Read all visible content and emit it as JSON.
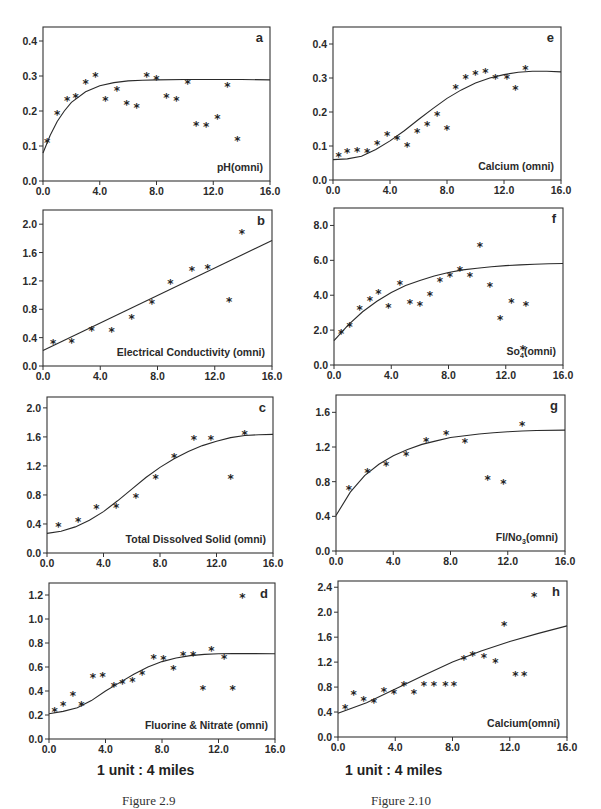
{
  "figures": [
    {
      "caption": "Figure 2.9",
      "scale_label": "1 unit : 4 miles"
    },
    {
      "caption": "Figure 2.10",
      "scale_label": "1 unit : 4 miles"
    }
  ],
  "chart_data": [
    {
      "id": "a",
      "type": "scatter",
      "title": "a",
      "annotation": "pH(omni)",
      "xlabel": "",
      "ylabel": "",
      "xlim": [
        0,
        16
      ],
      "ylim": [
        0,
        0.44
      ],
      "xticks": [
        0,
        4,
        8,
        12,
        16
      ],
      "xtick_labels": [
        "0.0",
        "4.0",
        "8.0",
        "12.0",
        "16.0"
      ],
      "yticks": [
        0,
        0.1,
        0.2,
        0.3,
        0.4
      ],
      "ytick_labels": [
        "0.0",
        "0.1",
        "0.2",
        "0.3",
        "0.4"
      ],
      "points": [
        [
          0.3,
          0.11
        ],
        [
          1.0,
          0.19
        ],
        [
          1.7,
          0.23
        ],
        [
          2.3,
          0.24
        ],
        [
          3.0,
          0.28
        ],
        [
          3.7,
          0.3
        ],
        [
          4.4,
          0.23
        ],
        [
          5.2,
          0.26
        ],
        [
          5.9,
          0.22
        ],
        [
          6.6,
          0.21
        ],
        [
          7.3,
          0.3
        ],
        [
          8.0,
          0.29
        ],
        [
          8.7,
          0.24
        ],
        [
          9.4,
          0.23
        ],
        [
          10.2,
          0.28
        ],
        [
          10.8,
          0.16
        ],
        [
          11.5,
          0.155
        ],
        [
          12.3,
          0.18
        ],
        [
          13.0,
          0.27
        ],
        [
          13.7,
          0.115
        ]
      ],
      "fit_curve": [
        [
          0,
          0.08
        ],
        [
          0.5,
          0.13
        ],
        [
          1,
          0.17
        ],
        [
          1.5,
          0.2
        ],
        [
          2,
          0.225
        ],
        [
          3,
          0.255
        ],
        [
          4,
          0.272
        ],
        [
          5,
          0.281
        ],
        [
          6,
          0.286
        ],
        [
          7,
          0.288
        ],
        [
          8,
          0.289
        ],
        [
          10,
          0.29
        ],
        [
          12,
          0.29
        ],
        [
          14,
          0.29
        ],
        [
          16,
          0.289
        ]
      ],
      "grid": false,
      "legend": "none"
    },
    {
      "id": "b",
      "type": "scatter",
      "title": "b",
      "annotation": "Electrical Conductivity (omni)",
      "xlabel": "",
      "ylabel": "",
      "xlim": [
        0,
        16
      ],
      "ylim": [
        0,
        2.2
      ],
      "xticks": [
        0,
        4,
        8,
        12,
        16
      ],
      "xtick_labels": [
        "0.0",
        "4.0",
        "8.0",
        "12.0",
        "16.0"
      ],
      "yticks": [
        0,
        0.4,
        0.8,
        1.2,
        1.6,
        2.0
      ],
      "ytick_labels": [
        "0.0",
        "0.4",
        "0.8",
        "1.2",
        "1.6",
        "2.0"
      ],
      "points": [
        [
          0.7,
          0.32
        ],
        [
          2.0,
          0.33
        ],
        [
          3.4,
          0.5
        ],
        [
          4.8,
          0.48
        ],
        [
          6.2,
          0.67
        ],
        [
          7.6,
          0.88
        ],
        [
          8.9,
          1.16
        ],
        [
          10.4,
          1.35
        ],
        [
          11.5,
          1.37
        ],
        [
          13.0,
          0.91
        ],
        [
          13.9,
          1.87
        ]
      ],
      "fit_curve": [
        [
          0,
          0.22
        ],
        [
          16,
          1.77
        ]
      ],
      "grid": false,
      "legend": "none"
    },
    {
      "id": "c",
      "type": "scatter",
      "title": "c",
      "annotation": "Total Dissolved Solid (omni)",
      "xlabel": "",
      "ylabel": "",
      "xlim": [
        0,
        16
      ],
      "ylim": [
        0,
        2.15
      ],
      "xticks": [
        0,
        4,
        8,
        12,
        16
      ],
      "xtick_labels": [
        "0.0",
        "4.0",
        "8.0",
        "12.0",
        "16.0"
      ],
      "yticks": [
        0,
        0.4,
        0.8,
        1.2,
        1.6,
        2.0
      ],
      "ytick_labels": [
        "0.0",
        "0.4",
        "0.8",
        "1.2",
        "1.6",
        "2.0"
      ],
      "points": [
        [
          0.8,
          0.36
        ],
        [
          2.2,
          0.43
        ],
        [
          3.5,
          0.62
        ],
        [
          4.9,
          0.63
        ],
        [
          6.3,
          0.77
        ],
        [
          7.7,
          1.03
        ],
        [
          9.0,
          1.31
        ],
        [
          10.4,
          1.56
        ],
        [
          11.6,
          1.56
        ],
        [
          13.0,
          1.02
        ],
        [
          14.0,
          1.63
        ]
      ],
      "fit_curve": [
        [
          0,
          0.27
        ],
        [
          1,
          0.3
        ],
        [
          2,
          0.36
        ],
        [
          3,
          0.45
        ],
        [
          4,
          0.57
        ],
        [
          5,
          0.72
        ],
        [
          6,
          0.88
        ],
        [
          7,
          1.04
        ],
        [
          8,
          1.18
        ],
        [
          9,
          1.3
        ],
        [
          10,
          1.4
        ],
        [
          11,
          1.48
        ],
        [
          12,
          1.54
        ],
        [
          13,
          1.59
        ],
        [
          14,
          1.62
        ],
        [
          15,
          1.63
        ],
        [
          16,
          1.635
        ]
      ],
      "grid": false,
      "legend": "none"
    },
    {
      "id": "d",
      "type": "scatter",
      "title": "d",
      "annotation": "Fluorine & Nitrate (omni)",
      "xlabel": "1 unit : 4 miles",
      "ylabel": "",
      "xlim": [
        0,
        16
      ],
      "ylim": [
        0,
        1.3
      ],
      "xticks": [
        0,
        4,
        8,
        12,
        16
      ],
      "xtick_labels": [
        "0.0",
        "4.0",
        "8.0",
        "12.0",
        "16.0"
      ],
      "yticks": [
        0,
        0.2,
        0.4,
        0.6,
        0.8,
        1.0,
        1.2
      ],
      "ytick_labels": [
        "0.0",
        "0.2",
        "0.4",
        "0.6",
        "0.8",
        "1.0",
        "1.2"
      ],
      "points": [
        [
          0.4,
          0.23
        ],
        [
          1.0,
          0.28
        ],
        [
          1.7,
          0.36
        ],
        [
          2.3,
          0.28
        ],
        [
          3.1,
          0.51
        ],
        [
          3.8,
          0.52
        ],
        [
          4.6,
          0.44
        ],
        [
          5.2,
          0.46
        ],
        [
          5.9,
          0.48
        ],
        [
          6.6,
          0.54
        ],
        [
          7.4,
          0.67
        ],
        [
          8.1,
          0.66
        ],
        [
          8.8,
          0.58
        ],
        [
          9.5,
          0.7
        ],
        [
          10.2,
          0.7
        ],
        [
          10.9,
          0.41
        ],
        [
          11.5,
          0.74
        ],
        [
          12.4,
          0.67
        ],
        [
          13.0,
          0.41
        ],
        [
          13.7,
          1.18
        ]
      ],
      "fit_curve": [
        [
          0,
          0.21
        ],
        [
          1,
          0.23
        ],
        [
          2,
          0.26
        ],
        [
          3,
          0.32
        ],
        [
          4,
          0.4
        ],
        [
          5,
          0.47
        ],
        [
          6,
          0.54
        ],
        [
          7,
          0.6
        ],
        [
          8,
          0.645
        ],
        [
          9,
          0.675
        ],
        [
          10,
          0.695
        ],
        [
          11,
          0.705
        ],
        [
          12,
          0.71
        ],
        [
          13,
          0.712
        ],
        [
          14,
          0.712
        ],
        [
          16,
          0.71
        ]
      ],
      "grid": false,
      "legend": "none"
    },
    {
      "id": "e",
      "type": "scatter",
      "title": "e",
      "annotation": "Calcium (omni)",
      "xlabel": "",
      "ylabel": "",
      "xlim": [
        0,
        16
      ],
      "ylim": [
        0,
        0.45
      ],
      "xticks": [
        0,
        4,
        8,
        12,
        16
      ],
      "xtick_labels": [
        "0.0",
        "4.0",
        "8.0",
        "12.0",
        "16.0"
      ],
      "yticks": [
        0,
        0.1,
        0.2,
        0.3,
        0.4
      ],
      "ytick_labels": [
        "0.0",
        "0.1",
        "0.2",
        "0.3",
        "0.4"
      ],
      "points": [
        [
          0.4,
          0.07
        ],
        [
          1.0,
          0.08
        ],
        [
          1.7,
          0.085
        ],
        [
          2.4,
          0.08
        ],
        [
          3.1,
          0.105
        ],
        [
          3.8,
          0.13
        ],
        [
          4.5,
          0.12
        ],
        [
          5.2,
          0.1
        ],
        [
          5.9,
          0.14
        ],
        [
          6.6,
          0.16
        ],
        [
          7.3,
          0.19
        ],
        [
          8.0,
          0.15
        ],
        [
          8.6,
          0.27
        ],
        [
          9.3,
          0.3
        ],
        [
          10.0,
          0.31
        ],
        [
          10.7,
          0.315
        ],
        [
          11.4,
          0.3
        ],
        [
          12.2,
          0.3
        ],
        [
          12.8,
          0.265
        ],
        [
          13.5,
          0.325
        ]
      ],
      "fit_curve": [
        [
          0,
          0.06
        ],
        [
          1,
          0.062
        ],
        [
          2,
          0.07
        ],
        [
          3,
          0.09
        ],
        [
          4,
          0.115
        ],
        [
          5,
          0.145
        ],
        [
          6,
          0.178
        ],
        [
          7,
          0.21
        ],
        [
          8,
          0.24
        ],
        [
          9,
          0.265
        ],
        [
          10,
          0.285
        ],
        [
          11,
          0.3
        ],
        [
          12,
          0.31
        ],
        [
          13,
          0.317
        ],
        [
          14,
          0.32
        ],
        [
          15,
          0.32
        ],
        [
          16,
          0.318
        ]
      ],
      "grid": false,
      "legend": "none"
    },
    {
      "id": "f",
      "type": "scatter",
      "title": "f",
      "annotation": "So4(omni)",
      "xlabel": "",
      "ylabel": "",
      "xlim": [
        0,
        16
      ],
      "ylim": [
        0,
        9.0
      ],
      "xticks": [
        0,
        4,
        8,
        12,
        16
      ],
      "xtick_labels": [
        "0.0",
        "4.0",
        "8.0",
        "12.0",
        "16.0"
      ],
      "yticks": [
        0,
        2,
        4,
        6,
        8
      ],
      "ytick_labels": [
        "0.0",
        "2.0",
        "4.0",
        "6.0",
        "8.0"
      ],
      "points": [
        [
          0.5,
          1.8
        ],
        [
          1.1,
          2.2
        ],
        [
          1.8,
          3.2
        ],
        [
          2.5,
          3.7
        ],
        [
          3.1,
          4.1
        ],
        [
          3.8,
          3.3
        ],
        [
          4.6,
          4.6
        ],
        [
          5.3,
          3.5
        ],
        [
          6.0,
          3.4
        ],
        [
          6.7,
          4.0
        ],
        [
          7.4,
          4.8
        ],
        [
          8.1,
          5.1
        ],
        [
          8.8,
          5.4
        ],
        [
          9.5,
          5.1
        ],
        [
          10.2,
          6.8
        ],
        [
          10.9,
          4.5
        ],
        [
          11.6,
          2.6
        ],
        [
          12.4,
          3.6
        ],
        [
          13.2,
          0.9
        ],
        [
          13.4,
          3.4
        ]
      ],
      "fit_curve": [
        [
          0,
          1.4
        ],
        [
          1,
          2.3
        ],
        [
          2,
          3.05
        ],
        [
          3,
          3.65
        ],
        [
          4,
          4.15
        ],
        [
          5,
          4.55
        ],
        [
          6,
          4.85
        ],
        [
          7,
          5.1
        ],
        [
          8,
          5.3
        ],
        [
          9,
          5.45
        ],
        [
          10,
          5.55
        ],
        [
          11,
          5.63
        ],
        [
          12,
          5.7
        ],
        [
          13,
          5.74
        ],
        [
          14,
          5.77
        ],
        [
          15,
          5.8
        ],
        [
          16,
          5.82
        ]
      ],
      "grid": false,
      "legend": "none"
    },
    {
      "id": "g",
      "type": "scatter",
      "title": "g",
      "annotation": "Fl/No3(omni)",
      "xlabel": "",
      "ylabel": "",
      "xlim": [
        0,
        16
      ],
      "ylim": [
        0,
        1.8
      ],
      "xticks": [
        0,
        4,
        8,
        12,
        16
      ],
      "xtick_labels": [
        "0.0",
        "4.0",
        "8.0",
        "12.0",
        "16.0"
      ],
      "yticks": [
        0,
        0.4,
        0.8,
        1.2,
        1.6
      ],
      "ytick_labels": [
        "0.0",
        "0.4",
        "0.8",
        "1.2",
        "1.6"
      ],
      "points": [
        [
          0.9,
          0.71
        ],
        [
          2.2,
          0.91
        ],
        [
          3.5,
          0.99
        ],
        [
          4.9,
          1.1
        ],
        [
          6.3,
          1.26
        ],
        [
          7.7,
          1.35
        ],
        [
          9.0,
          1.25
        ],
        [
          10.6,
          0.82
        ],
        [
          11.7,
          0.78
        ],
        [
          13.0,
          1.45
        ]
      ],
      "fit_curve": [
        [
          0,
          0.41
        ],
        [
          1,
          0.68
        ],
        [
          2,
          0.87
        ],
        [
          3,
          1.0
        ],
        [
          4,
          1.1
        ],
        [
          5,
          1.17
        ],
        [
          6,
          1.23
        ],
        [
          7,
          1.27
        ],
        [
          8,
          1.31
        ],
        [
          9,
          1.33
        ],
        [
          10,
          1.35
        ],
        [
          11,
          1.365
        ],
        [
          12,
          1.375
        ],
        [
          13,
          1.385
        ],
        [
          14,
          1.39
        ],
        [
          16,
          1.395
        ]
      ],
      "grid": false,
      "legend": "none"
    },
    {
      "id": "h",
      "type": "scatter",
      "title": "h",
      "annotation": "Calcium(omni)",
      "xlabel": "1 unit : 4 miles",
      "ylabel": "",
      "xlim": [
        0,
        16
      ],
      "ylim": [
        0,
        2.5
      ],
      "xticks": [
        0,
        4,
        8,
        12,
        16
      ],
      "xtick_labels": [
        "0.0",
        "4.0",
        "8.0",
        "12.0",
        "16.0"
      ],
      "yticks": [
        0,
        0.4,
        0.8,
        1.2,
        1.6,
        2.0,
        2.4
      ],
      "ytick_labels": [
        "0.0",
        "0.4",
        "0.8",
        "1.2",
        "1.6",
        "2.0",
        "2.4"
      ],
      "points": [
        [
          0.5,
          0.45
        ],
        [
          1.1,
          0.68
        ],
        [
          1.8,
          0.58
        ],
        [
          2.5,
          0.56
        ],
        [
          3.2,
          0.73
        ],
        [
          3.9,
          0.69
        ],
        [
          4.6,
          0.82
        ],
        [
          5.3,
          0.7
        ],
        [
          6.0,
          0.82
        ],
        [
          6.7,
          0.82
        ],
        [
          7.5,
          0.83
        ],
        [
          8.1,
          0.82
        ],
        [
          8.8,
          1.25
        ],
        [
          9.4,
          1.3
        ],
        [
          10.2,
          1.27
        ],
        [
          11.0,
          1.19
        ],
        [
          11.6,
          1.78
        ],
        [
          12.4,
          0.98
        ],
        [
          13.0,
          0.98
        ],
        [
          13.7,
          2.25
        ]
      ],
      "fit_curve": [
        [
          0,
          0.38
        ],
        [
          2,
          0.55
        ],
        [
          4,
          0.77
        ],
        [
          6,
          0.99
        ],
        [
          8,
          1.2
        ],
        [
          10,
          1.38
        ],
        [
          12,
          1.53
        ],
        [
          14,
          1.66
        ],
        [
          16,
          1.78
        ]
      ],
      "grid": false,
      "legend": "none"
    }
  ]
}
